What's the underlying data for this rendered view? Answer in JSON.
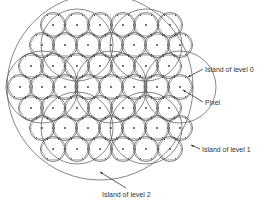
{
  "diagram": {
    "labels": {
      "level0": "Island of level 0",
      "pixel": "Pixel",
      "level1": "Island of level 1",
      "level2": "Island of level 2"
    },
    "colors": {
      "stroke": "#555555",
      "background": "#ffffff",
      "text": "#333333"
    },
    "level0_radius": 12.5,
    "level0_rows": [
      {
        "y": 25,
        "xs": [
          53,
          77,
          100,
          123,
          146,
          170
        ]
      },
      {
        "y": 45,
        "xs": [
          42,
          65,
          88,
          111,
          134,
          157,
          180
        ]
      },
      {
        "y": 66,
        "xs": [
          31,
          53,
          77,
          100,
          123,
          146,
          169
        ]
      },
      {
        "y": 87,
        "xs": [
          20,
          42,
          65,
          88,
          111,
          134,
          157,
          180
        ]
      },
      {
        "y": 108,
        "xs": [
          31,
          53,
          77,
          100,
          123,
          146,
          169
        ]
      },
      {
        "y": 128,
        "xs": [
          42,
          65,
          88,
          111,
          134,
          157,
          180
        ]
      },
      {
        "y": 149,
        "xs": [
          53,
          77,
          100,
          123,
          146,
          170
        ]
      }
    ],
    "level1_islands": [
      {
        "cx": 77,
        "cy": 45,
        "r": 36
      },
      {
        "cx": 146,
        "cy": 45,
        "r": 36
      },
      {
        "cx": 42,
        "cy": 87,
        "r": 36
      },
      {
        "cx": 111,
        "cy": 87,
        "r": 36
      },
      {
        "cx": 77,
        "cy": 128,
        "r": 36
      },
      {
        "cx": 146,
        "cy": 128,
        "r": 36
      },
      {
        "cx": 180,
        "cy": 87,
        "r": 36
      }
    ],
    "level2_island": {
      "cx": 100,
      "cy": 87,
      "r": 93
    }
  }
}
